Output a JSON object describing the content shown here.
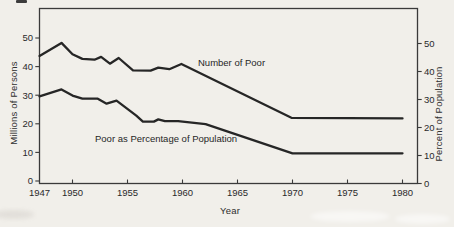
{
  "chart_data": {
    "type": "line",
    "title": "",
    "xlabel": "Year",
    "ylabel_left": "Millions of Persons",
    "ylabel_right": "Percent of Population",
    "x_ticks": [
      "1947",
      "1950",
      "1955",
      "1960",
      "1965",
      "1970",
      "1975",
      "1980"
    ],
    "y_ticks_left": [
      50,
      40,
      30,
      20,
      10,
      0
    ],
    "y_ticks_right": [
      50,
      40,
      30,
      20,
      10,
      0
    ],
    "xlim": [
      1947,
      1981.5
    ],
    "ylim_left": [
      0,
      60
    ],
    "ylim_right": [
      0,
      62
    ],
    "grid": false,
    "legend_position": "inline-labels",
    "line_color": "#262626",
    "frame_color": "#3a3a3a",
    "series": [
      {
        "name": "Number of Poor",
        "axis": "left",
        "unit": "millions of persons",
        "points": [
          [
            1947,
            43.7
          ],
          [
            1949,
            48.3
          ],
          [
            1950,
            44.3
          ],
          [
            1950.9,
            42.7
          ],
          [
            1952,
            42.4
          ],
          [
            1952.6,
            43.4
          ],
          [
            1953.4,
            41.0
          ],
          [
            1954.2,
            43.0
          ],
          [
            1955.5,
            38.7
          ],
          [
            1957.1,
            38.6
          ],
          [
            1957.8,
            39.6
          ],
          [
            1958.8,
            39.1
          ],
          [
            1959.9,
            40.9
          ],
          [
            1969.9,
            22.1
          ],
          [
            1980,
            21.9
          ]
        ]
      },
      {
        "name": "Poor as Percentage of Population",
        "axis": "right",
        "unit": "percent",
        "points": [
          [
            1947,
            31.1
          ],
          [
            1949,
            33.6
          ],
          [
            1950,
            31.4
          ],
          [
            1950.9,
            30.3
          ],
          [
            1952.3,
            30.3
          ],
          [
            1953.1,
            28.5
          ],
          [
            1954,
            29.6
          ],
          [
            1955.8,
            24.2
          ],
          [
            1956.4,
            22.1
          ],
          [
            1957.4,
            22.1
          ],
          [
            1957.8,
            22.9
          ],
          [
            1958.4,
            22.3
          ],
          [
            1959.6,
            22.3
          ],
          [
            1962.1,
            21.2
          ],
          [
            1970,
            10.8
          ],
          [
            1980,
            10.8
          ]
        ]
      }
    ]
  }
}
